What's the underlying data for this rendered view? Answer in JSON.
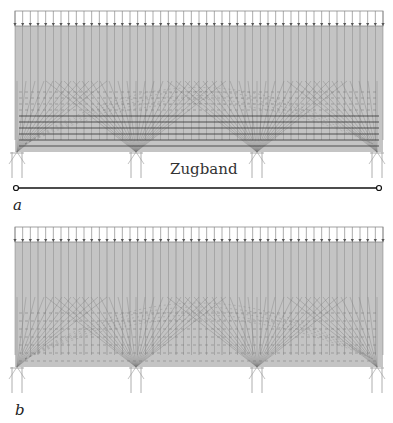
{
  "figure": {
    "panels": [
      {
        "id": "a",
        "label": "a",
        "description": "Stress trajectories in wall-like beam on four supports with tension tie",
        "tie_label": "Zugband",
        "support_count": 4,
        "load": "uniform distributed load (arrows on top edge)"
      },
      {
        "id": "b",
        "label": "b",
        "description": "Stress trajectories in wall-like beam on four supports without tension tie",
        "support_count": 4,
        "load": "uniform distributed load (arrows on top edge)"
      }
    ],
    "colors": {
      "beam_fill": "#c4c4c4",
      "trajectory_lines": "#7a7a7a",
      "tension_lines": "#3a3a3a",
      "tie_line": "#111111",
      "support_lines": "#9a9a9a"
    }
  }
}
